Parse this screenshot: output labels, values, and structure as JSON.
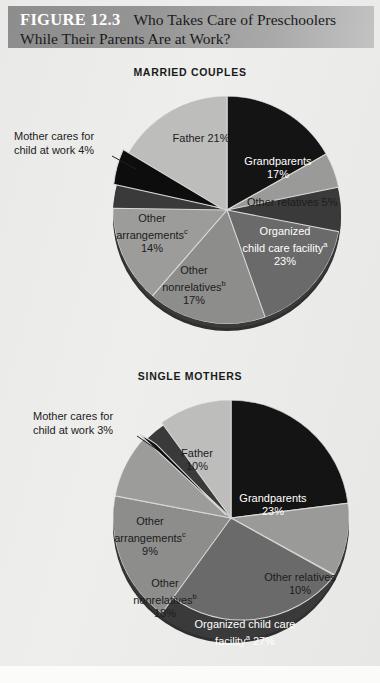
{
  "figure": {
    "number_label": "FIGURE 12.3",
    "title_line1": "Who Takes Care of Preschoolers",
    "title_line2": "While Their Parents Are at Work?"
  },
  "chart_data": [
    {
      "type": "pie",
      "title": "MARRIED COUPLES",
      "categories": [
        "Grandparents",
        "Other relatives",
        "Organized child care facility",
        "Other nonrelatives",
        "Other arrangements",
        "Mother cares for child at work",
        "Father"
      ],
      "values": [
        17,
        5,
        23,
        17,
        14,
        4,
        21
      ],
      "value_labels": [
        "17%",
        "5%",
        "23%",
        "17%",
        "14%",
        "4%",
        "21%"
      ],
      "footnote_marks": [
        "",
        "",
        "a",
        "b",
        "c",
        "",
        ""
      ],
      "colors": [
        "#141414",
        "#9a9a99",
        "#6a6a6a",
        "#8d8d8c",
        "#9c9c9b",
        "#0d0d0d",
        "#bdbdbc"
      ],
      "label_text_colors": [
        "light",
        "dark",
        "light",
        "dark",
        "dark",
        "dark",
        "dark"
      ],
      "exploded": [
        "Mother cares for child at work"
      ],
      "callouts": [
        "Mother cares for child at work"
      ],
      "slice_labels": [
        {
          "name": "grandparents",
          "line1": "Grandparents",
          "line2": "17%"
        },
        {
          "name": "other-relatives",
          "line1": "Other relatives  5%",
          "line2": ""
        },
        {
          "name": "organized-child-care",
          "line1": "Organized",
          "line2": "child care facility",
          "mark": "a",
          "line3": "23%"
        },
        {
          "name": "other-nonrelatives",
          "line1": "Other",
          "line2": "nonrelatives",
          "mark": "b",
          "line3": "17%"
        },
        {
          "name": "other-arrangements",
          "line1": "Other",
          "line2": "arrangements",
          "mark": "c",
          "line3": "14%"
        },
        {
          "name": "father",
          "line1": "Father  21%",
          "line2": ""
        }
      ],
      "callout_label": {
        "line1": "Mother cares for",
        "line2": "child at work  4%"
      }
    },
    {
      "type": "pie",
      "title": "SINGLE MOTHERS",
      "categories": [
        "Grandparents",
        "Other relatives",
        "Organized child care facility",
        "Other nonrelatives",
        "Other arrangements",
        "Mother cares for child at work",
        "Father"
      ],
      "values": [
        23,
        10,
        27,
        18,
        9,
        3,
        10
      ],
      "value_labels": [
        "23%",
        "10%",
        "27%",
        "18%",
        "9%",
        "3%",
        "10%"
      ],
      "footnote_marks": [
        "",
        "",
        "a",
        "b",
        "c",
        "",
        ""
      ],
      "colors": [
        "#141414",
        "#9a9a99",
        "#6a6a6a",
        "#8d8d8c",
        "#9c9c9b",
        "#0d0d0d",
        "#bdbdbc"
      ],
      "label_text_colors": [
        "light",
        "dark",
        "light",
        "dark",
        "dark",
        "dark",
        "dark"
      ],
      "exploded": [
        "Mother cares for child at work"
      ],
      "callouts": [
        "Mother cares for child at work"
      ],
      "slice_labels": [
        {
          "name": "grandparents",
          "line1": "Grandparents",
          "line2": "23%"
        },
        {
          "name": "other-relatives",
          "line1": "Other relatives",
          "line2": "10%"
        },
        {
          "name": "organized-child-care",
          "line1": "Organized child care",
          "line2": "facility",
          "mark": "a",
          "line3": "27%"
        },
        {
          "name": "other-nonrelatives",
          "line1": "Other",
          "line2": "nonrelatives",
          "mark": "b",
          "line3": "18%"
        },
        {
          "name": "other-arrangements",
          "line1": "Other",
          "line2": "arrangements",
          "mark": "c",
          "line3": "9%"
        },
        {
          "name": "father",
          "line1": "Father",
          "line2": "10%"
        }
      ],
      "callout_label": {
        "line1": "Mother cares for",
        "line2": "child at work  3%"
      }
    }
  ]
}
